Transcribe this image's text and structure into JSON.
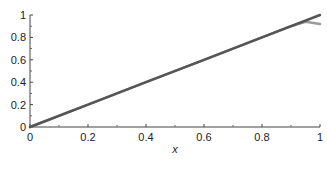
{
  "chart_data": {
    "type": "line",
    "title": "",
    "xlabel": "x",
    "ylabel": "",
    "xlim": [
      0,
      1
    ],
    "ylim": [
      0,
      1
    ],
    "grid": false,
    "legend": null,
    "x_ticks": [
      "0",
      "0.2",
      "0.4",
      "0.6",
      "0.8",
      "1"
    ],
    "y_ticks": [
      "0",
      "0.2",
      "0.4",
      "0.6",
      "0.8",
      "1"
    ],
    "series": [
      {
        "name": "exact",
        "color": "#555555",
        "x": [
          0,
          0.2,
          0.4,
          0.6,
          0.8,
          1.0
        ],
        "y": [
          0,
          0.2,
          0.4,
          0.6,
          0.8,
          1.0
        ]
      },
      {
        "name": "approximation",
        "color": "#9a9a9a",
        "x": [
          0,
          0.2,
          0.4,
          0.6,
          0.8,
          0.9,
          0.95,
          1.0
        ],
        "y": [
          0,
          0.2,
          0.4,
          0.6,
          0.8,
          0.9,
          0.94,
          0.92
        ]
      }
    ]
  },
  "axes": {
    "x_label": "x",
    "x_ticks": [
      "0",
      "0.2",
      "0.4",
      "0.6",
      "0.8",
      "1"
    ],
    "y_ticks": [
      "0",
      "0.2",
      "0.4",
      "0.6",
      "0.8",
      "1"
    ]
  }
}
